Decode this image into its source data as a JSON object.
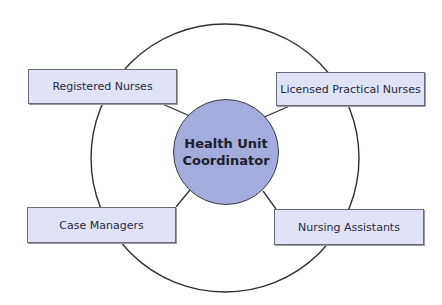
{
  "diagram": {
    "center": {
      "line1": "Health Unit",
      "line2": "Coordinator",
      "fill": "#a3acdb"
    },
    "nodes": [
      {
        "id": "registered-nurses",
        "label": "Registered Nurses",
        "position": "top-left"
      },
      {
        "id": "licensed-practical-nurses",
        "label": "Licensed Practical Nurses",
        "position": "top-right"
      },
      {
        "id": "case-managers",
        "label": "Case Managers",
        "position": "bottom-left"
      },
      {
        "id": "nursing-assistants",
        "label": "Nursing Assistants",
        "position": "bottom-right"
      }
    ],
    "box_fill": "#dfe3f5",
    "outer_ring": "circle"
  }
}
